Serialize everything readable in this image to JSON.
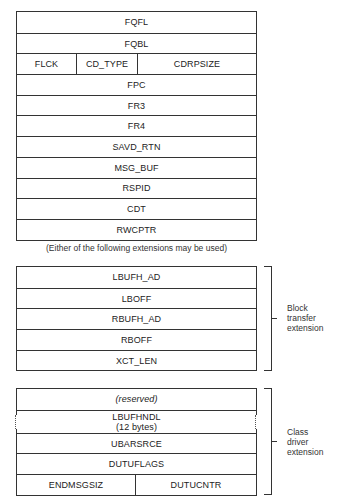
{
  "main_structure": {
    "rows": [
      {
        "cells": [
          "FQFL"
        ]
      },
      {
        "cells": [
          "FQBL"
        ]
      },
      {
        "cells": [
          "FLCK",
          "CD_TYPE",
          "CDRPSIZE"
        ]
      },
      {
        "cells": [
          "FPC"
        ]
      },
      {
        "cells": [
          "FR3"
        ]
      },
      {
        "cells": [
          "FR4"
        ]
      },
      {
        "cells": [
          "SAVD_RTN"
        ]
      },
      {
        "cells": [
          "MSG_BUF"
        ]
      },
      {
        "cells": [
          "RSPID"
        ]
      },
      {
        "cells": [
          "CDT"
        ]
      },
      {
        "cells": [
          "RWCPTR"
        ]
      }
    ]
  },
  "caption": "(Either of the following extensions may be used)",
  "block_transfer_extension": {
    "label": [
      "Block",
      "transfer",
      "extension"
    ],
    "rows": [
      {
        "cells": [
          "LBUFH_AD"
        ]
      },
      {
        "cells": [
          "LBOFF"
        ]
      },
      {
        "cells": [
          "RBUFH_AD"
        ]
      },
      {
        "cells": [
          "RBOFF"
        ]
      },
      {
        "cells": [
          "XCT_LEN"
        ]
      }
    ]
  },
  "class_driver_extension": {
    "label": [
      "Class",
      "driver",
      "extension"
    ],
    "rows": [
      {
        "cells": [
          "(reserved)"
        ]
      },
      {
        "cells": [
          "LBUFHNDL",
          "(12 bytes)"
        ]
      },
      {
        "cells": [
          "UBARSRCE"
        ]
      },
      {
        "cells": [
          "DUTUFLAGS"
        ]
      },
      {
        "cells": [
          "ENDMSGSIZ",
          "DUTUCNTR"
        ]
      }
    ]
  }
}
